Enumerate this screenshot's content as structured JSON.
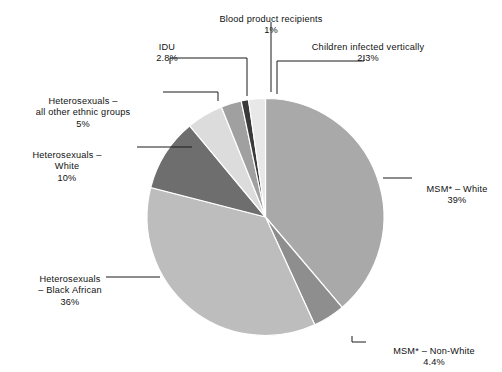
{
  "chart_data": {
    "type": "pie",
    "title": "",
    "unit": "%",
    "legend": "none",
    "labels_outside": true,
    "categories": [
      "MSM* – White",
      "MSM* – Non-White",
      "Heterosexuals – Black African",
      "Heterosexuals – White",
      "Heterosexuals – all other ethnic groups",
      "IDU",
      "Blood product recipients",
      "Children infected vertically"
    ],
    "values": [
      39,
      4.4,
      36,
      10,
      5,
      2.8,
      1,
      2.3
    ],
    "value_labels": [
      "39%",
      "4.4%",
      "36%",
      "10%",
      "5%",
      "2.8%",
      "1%",
      "2.3%"
    ],
    "colors": [
      "#a9a9a9",
      "#8e8e8e",
      "#bdbdbd",
      "#6e6e6e",
      "#dcdcdc",
      "#a0a0a0",
      "#3a3a3a",
      "#e8e8e8"
    ]
  },
  "callouts": {
    "blood": {
      "name": "Blood product recipients",
      "pct": "1%"
    },
    "idu": {
      "name": "IDU",
      "pct": "2.8%"
    },
    "children": {
      "name": "Children infected vertically",
      "pct": "2.3%"
    },
    "het_other": {
      "name": "Heterosexuals –\nall other ethnic groups",
      "pct": "5%"
    },
    "het_white": {
      "name": "Heterosexuals –\nWhite",
      "pct": "10%"
    },
    "het_black": {
      "name": "Heterosexuals\n– Black African",
      "pct": "36%"
    },
    "msm_white": {
      "name": "MSM* – White",
      "pct": "39%"
    },
    "msm_nonwhite": {
      "name": "MSM* – Non-White",
      "pct": "4.4%"
    }
  }
}
